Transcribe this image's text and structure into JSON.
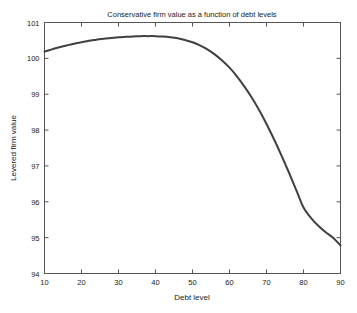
{
  "chart_data": {
    "type": "line",
    "title": "Conservative firm value as a function of debt levels",
    "xlabel": "Debt level",
    "ylabel": "Levered firm value",
    "xlim": [
      10,
      90
    ],
    "ylim": [
      94,
      101
    ],
    "xticks": [
      10,
      20,
      30,
      40,
      50,
      60,
      70,
      80,
      90
    ],
    "ytick_labels": [
      "94",
      "95",
      "96",
      "97",
      "98",
      "99",
      "100",
      "101"
    ],
    "xtick_labels": [
      "10",
      "20",
      "30",
      "40",
      "50",
      "60",
      "70",
      "80",
      "90"
    ],
    "yticks": [
      94,
      95,
      96,
      97,
      98,
      99,
      100,
      101
    ],
    "grid": false,
    "legend": false,
    "line_color": "#404040",
    "line_width": 2,
    "frame_color": "#555555",
    "background": "#ffffff",
    "series": [
      {
        "name": "Levered firm value",
        "x": [
          10,
          12,
          14,
          16,
          18,
          20,
          22,
          24,
          26,
          28,
          30,
          32,
          34,
          36,
          38,
          40,
          42,
          44,
          46,
          48,
          50,
          52,
          54,
          56,
          58,
          60,
          62,
          64,
          66,
          68,
          70,
          72,
          74,
          76,
          78,
          80,
          82,
          84,
          86,
          88,
          90
        ],
        "values": [
          100.19,
          100.25,
          100.31,
          100.36,
          100.41,
          100.45,
          100.49,
          100.52,
          100.55,
          100.57,
          100.59,
          100.6,
          100.61,
          100.62,
          100.62,
          100.62,
          100.61,
          100.59,
          100.56,
          100.51,
          100.45,
          100.36,
          100.25,
          100.11,
          99.94,
          99.74,
          99.5,
          99.22,
          98.91,
          98.56,
          98.17,
          97.75,
          97.3,
          96.83,
          96.34,
          95.84,
          95.55,
          95.33,
          95.15,
          95.0,
          94.78
        ]
      }
    ]
  }
}
